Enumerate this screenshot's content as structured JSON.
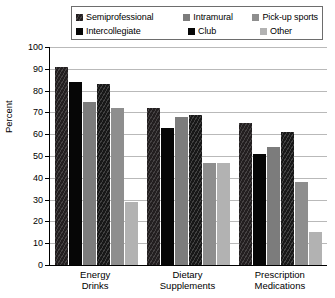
{
  "chart_data": {
    "type": "bar",
    "title": "",
    "xlabel": "",
    "ylabel": "Percent",
    "ylim": [
      0,
      100
    ],
    "ytick_step": 10,
    "yticks": [
      100,
      90,
      80,
      70,
      60,
      50,
      40,
      30,
      20,
      10,
      0
    ],
    "grid": true,
    "legend_position": "top",
    "categories": [
      "Energy Drinks",
      "Dietary Supplements",
      "Prescription Medications"
    ],
    "category_lines": [
      [
        "Energy",
        "Drinks"
      ],
      [
        "Dietary",
        "Supplements"
      ],
      [
        "Prescription",
        "Medications"
      ]
    ],
    "series": [
      {
        "name": "Semiprofessional",
        "color": "#231f20",
        "pattern": "diagonal-hatch",
        "values": [
          91,
          72,
          65
        ]
      },
      {
        "name": "Intercollegiate",
        "color": "#060606",
        "pattern": "solid",
        "values": [
          84,
          63,
          51
        ]
      },
      {
        "name": "Intramural",
        "color": "#7c7c7c",
        "pattern": "solid",
        "values": [
          75,
          68,
          54
        ]
      },
      {
        "name": "Club",
        "color": "#181818",
        "pattern": "diagonal-hatch",
        "values": [
          83,
          69,
          61
        ]
      },
      {
        "name": "Pick-up sports",
        "color": "#8e8e8e",
        "pattern": "solid",
        "values": [
          72,
          47,
          38
        ]
      },
      {
        "name": "Other",
        "color": "#b2b2b2",
        "pattern": "solid",
        "values": [
          29,
          47,
          15
        ]
      }
    ]
  },
  "legend": {
    "row1": [
      {
        "label": "Semiprofessional",
        "swatch": "#231f20"
      },
      {
        "label": "Intramural",
        "swatch": "#7c7c7c"
      },
      {
        "label": "Pick-up sports",
        "swatch": "#8e8e8e"
      }
    ],
    "row2": [
      {
        "label": "Intercollegiate",
        "swatch": "#060606"
      },
      {
        "label": "Club",
        "swatch": "#060606"
      },
      {
        "label": "Other",
        "swatch": "#b2b2b2"
      }
    ]
  },
  "axis": {
    "y_title": "Percent",
    "y_labels": [
      "100",
      "90",
      "80",
      "70",
      "60",
      "50",
      "40",
      "30",
      "20",
      "10",
      "0"
    ]
  }
}
